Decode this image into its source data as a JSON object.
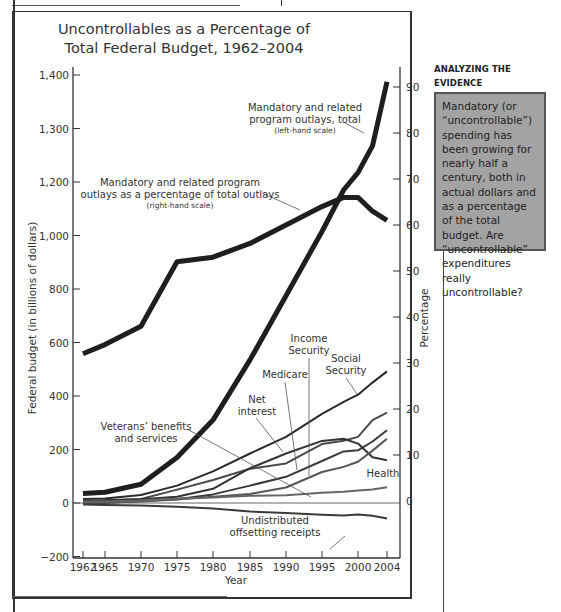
{
  "figure": {
    "title_line1": "Uncontrollables as a Percentage of",
    "title_line2": "Total Federal Budget, 1962–2004"
  },
  "sidebar": {
    "heading_line1": "ANALYZING THE",
    "heading_line2": "EVIDENCE",
    "body": "Mandatory (or “uncontrollable”) spending has been growing for nearly half a century, both in actual dollars and as a percentage of the total budget. Are “uncontrollable” expenditures really uncontrollable?",
    "box_color": "#a3a3a3"
  },
  "chart_data": {
    "type": "line",
    "title": "Uncontrollables as a Percentage of Total Federal Budget, 1962–2004",
    "xlabel": "Year",
    "ylabel": "Federal budget (in billions of dollars)",
    "y2label": "Percentage",
    "x_ticks": [
      "1962",
      "1965",
      "1970",
      "1975",
      "1980",
      "1985",
      "1990",
      "1995",
      "2000",
      "2004"
    ],
    "y_ticks_left": [
      "1,400",
      "1,300",
      "1,200",
      "1,000",
      "800",
      "600",
      "400",
      "200",
      "0",
      "−200"
    ],
    "y_ticks_right": [
      "90",
      "80",
      "70",
      "60",
      "50",
      "40",
      "30",
      "20",
      "10",
      "0"
    ],
    "ylim": [
      -200,
      1400
    ],
    "y2lim": [
      0,
      90
    ],
    "grid": false,
    "x": [
      1962,
      1965,
      1970,
      1975,
      1980,
      1985,
      1990,
      1995,
      1998,
      2000,
      2002,
      2004
    ],
    "series": [
      {
        "name": "Mandatory and related program outlays, total (left-hand scale)",
        "axis": "left",
        "style": "thick",
        "values": [
          35,
          40,
          70,
          170,
          310,
          535,
          775,
          1015,
          1170,
          1235,
          1335,
          1575
        ]
      },
      {
        "name": "Mandatory and related program outlays as a percentage of total outlays (right-hand scale)",
        "axis": "right",
        "style": "thick",
        "values": [
          32,
          34,
          38,
          52,
          53,
          56,
          60,
          64,
          66,
          66,
          63,
          61
        ]
      },
      {
        "name": "Social Security",
        "axis": "left",
        "values": [
          15,
          17,
          30,
          65,
          118,
          185,
          247,
          333,
          378,
          405,
          450,
          492
        ]
      },
      {
        "name": "Medicare",
        "axis": "left",
        "values": [
          0,
          0,
          7,
          14,
          32,
          65,
          98,
          157,
          193,
          197,
          230,
          272
        ]
      },
      {
        "name": "Income Security",
        "axis": "left",
        "values": [
          9,
          10,
          15,
          50,
          86,
          128,
          148,
          220,
          233,
          247,
          310,
          338
        ]
      },
      {
        "name": "Net interest",
        "axis": "left",
        "values": [
          7,
          9,
          14,
          23,
          53,
          130,
          185,
          232,
          240,
          222,
          171,
          160
        ]
      },
      {
        "name": "Health",
        "axis": "left",
        "values": [
          1,
          2,
          6,
          13,
          23,
          34,
          58,
          116,
          135,
          154,
          196,
          240
        ]
      },
      {
        "name": "Veterans' benefits and services",
        "axis": "left",
        "values": [
          5,
          6,
          9,
          17,
          21,
          27,
          29,
          38,
          42,
          47,
          51,
          59
        ]
      },
      {
        "name": "Undistributed offsetting receipts",
        "axis": "left",
        "values": [
          -6,
          -7,
          -9,
          -14,
          -20,
          -32,
          -37,
          -44,
          -47,
          -43,
          -48,
          -58
        ]
      }
    ],
    "annotations": [
      "Mandatory and related program outlays, total (left-hand scale)",
      "Mandatory and related program outlays as a percentage of total outlays (right-hand scale)",
      "Income Security",
      "Social Security",
      "Medicare",
      "Net interest",
      "Veterans' benefits and services",
      "Health",
      "Undistributed offsetting receipts"
    ]
  },
  "labels": {
    "total_line1": "Mandatory and related",
    "total_line2": "program outlays, total",
    "total_line3": "(left-hand scale)",
    "pct_line1": "Mandatory and related program",
    "pct_line2": "outlays as a percentage of total outlays",
    "pct_line3": "(right-hand scale)",
    "income1": "Income",
    "income2": "Security",
    "social1": "Social",
    "social2": "Security",
    "medicare": "Medicare",
    "net1": "Net",
    "net2": "interest",
    "vet1": "Veterans’ benefits",
    "vet2": "and services",
    "health": "Health",
    "undist1": "Undistributed",
    "undist2": "offsetting receipts",
    "xlabel": "Year",
    "ylabel": "Federal budget (in billions of dollars)",
    "y2label": "Percentage"
  }
}
